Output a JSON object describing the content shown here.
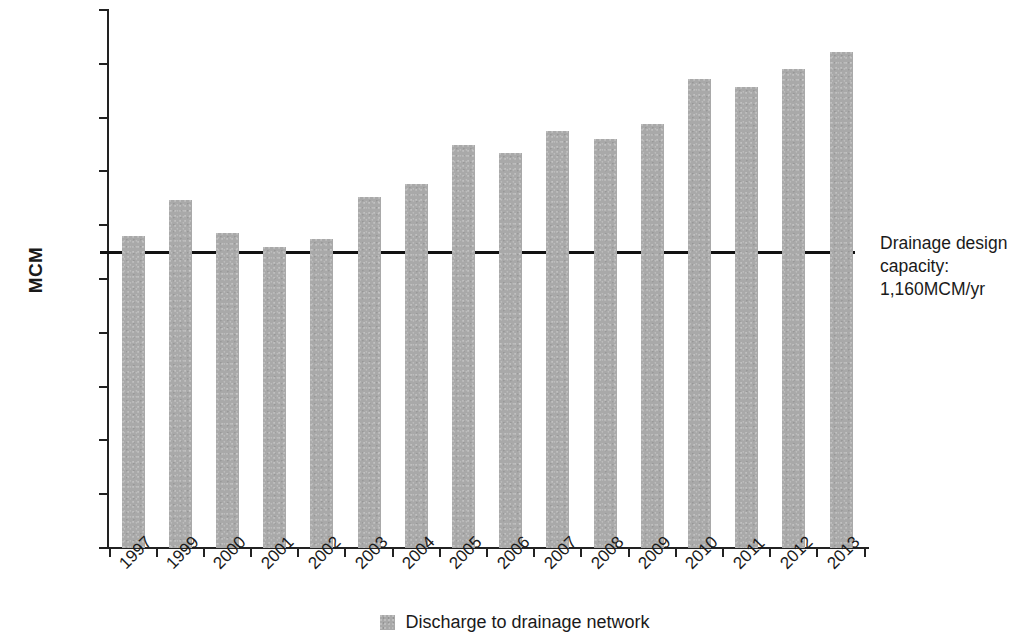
{
  "chart_data": {
    "type": "bar",
    "title": "",
    "xlabel": "",
    "ylabel": "MCM",
    "ylim": [
      0,
      2000
    ],
    "ytick_values": [
      0,
      200,
      400,
      600,
      800,
      1000,
      1200,
      1400,
      1600,
      1800,
      2000
    ],
    "ytick_labels": [
      "0",
      "200",
      "400",
      "600",
      "800",
      "1,000",
      "1,200",
      "1,400",
      "1,600",
      "1,800",
      "2,000"
    ],
    "grid": false,
    "legend_position": "bottom-center",
    "categories": [
      "1997",
      "1999",
      "2000",
      "2001",
      "2002",
      "2003",
      "2004",
      "2005",
      "2006",
      "2007",
      "2008",
      "2009",
      "2010",
      "2011",
      "2012",
      "2013"
    ],
    "series": [
      {
        "name": "Discharge to drainage network",
        "color": "#a9a9a9",
        "values": [
          1160,
          1295,
          1170,
          1120,
          1150,
          1305,
          1355,
          1500,
          1470,
          1550,
          1520,
          1575,
          1745,
          1715,
          1780,
          1845
        ]
      }
    ],
    "reference_line": {
      "name": "Drainage design capacity",
      "value": 1100,
      "color": "#111111",
      "label_lines": [
        "Drainage design",
        "capacity:",
        "1,160MCM/yr"
      ]
    }
  },
  "legend": {
    "items": [
      {
        "label": "Discharge to drainage network",
        "swatch_color": "#a9a9a9"
      }
    ]
  },
  "annotation": {
    "line1": "Drainage design",
    "line2": "capacity:",
    "line3": "1,160MCM/yr"
  }
}
